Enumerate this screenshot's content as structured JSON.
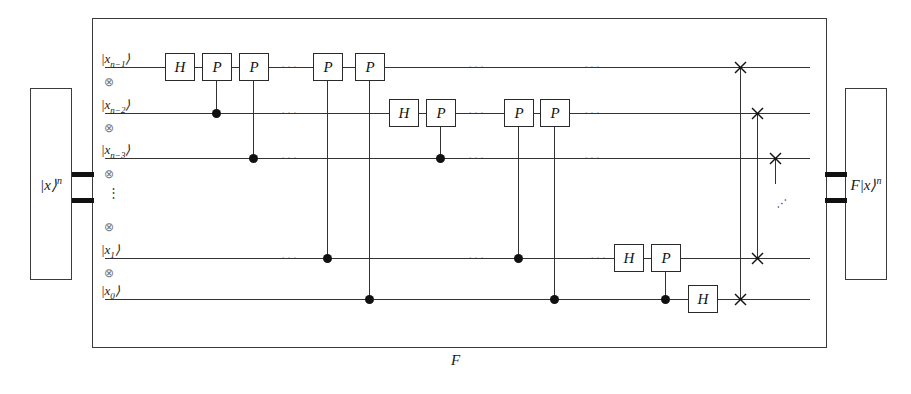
{
  "diagram": {
    "title_label": "F",
    "input_state": "|x⟩",
    "input_state_exponent": "n",
    "output_state": "F|x⟩",
    "output_state_exponent": "n",
    "tensor_symbol": "⊗",
    "vertical_dots": "⋮",
    "horizontal_dots": "···",
    "diagonal_dots": "···"
  },
  "wires": [
    {
      "id": "wire-n-1",
      "label": "|x",
      "sub": "n−1",
      "ket": "⟩"
    },
    {
      "id": "wire-n-2",
      "label": "|x",
      "sub": "n−2",
      "ket": "⟩"
    },
    {
      "id": "wire-n-3",
      "label": "|x",
      "sub": "n−3",
      "ket": "⟩"
    },
    {
      "id": "wire-1",
      "label": "|x",
      "sub": "1",
      "ket": "⟩"
    },
    {
      "id": "wire-0",
      "label": "|x",
      "sub": "0",
      "ket": "⟩"
    }
  ],
  "gates": {
    "hadamard": "H",
    "phase": "P",
    "row1": [
      "H",
      "P",
      "P",
      "P",
      "P"
    ],
    "row2": [
      "H",
      "P",
      "P",
      "P"
    ],
    "row4": [
      "H",
      "P"
    ],
    "row5": [
      "H"
    ]
  },
  "swap_count": 4,
  "colors": {
    "wire": "#333333",
    "frame": "#3b3b3b",
    "gate_border": "#2a2a2a",
    "control_dot": "#111111",
    "background": "#ffffff"
  }
}
